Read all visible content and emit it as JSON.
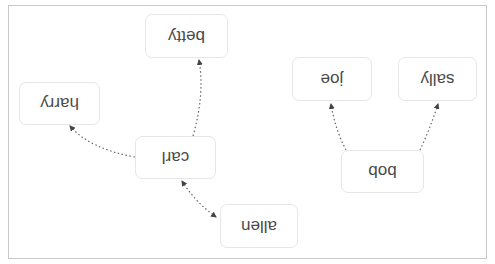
{
  "diagram": {
    "type": "tree-graph",
    "orientation": "rotated-180",
    "nodes": [
      {
        "id": "allen",
        "label": "allen"
      },
      {
        "id": "carl",
        "label": "carl"
      },
      {
        "id": "harry",
        "label": "harry"
      },
      {
        "id": "betty",
        "label": "betty"
      },
      {
        "id": "bob",
        "label": "bob"
      },
      {
        "id": "joe",
        "label": "joe"
      },
      {
        "id": "sally",
        "label": "sally"
      }
    ],
    "edges": [
      {
        "from": "allen",
        "to": "carl",
        "style": "dotted",
        "arrows": "both"
      },
      {
        "from": "carl",
        "to": "harry",
        "style": "dotted",
        "arrows": "to"
      },
      {
        "from": "carl",
        "to": "betty",
        "style": "dotted",
        "arrows": "to"
      },
      {
        "from": "bob",
        "to": "joe",
        "style": "dotted",
        "arrows": "to"
      },
      {
        "from": "bob",
        "to": "sally",
        "style": "dotted",
        "arrows": "to"
      }
    ],
    "colors": {
      "node_border": "#e6e6e6",
      "node_text": "#4a4a4a",
      "edge": "#555555",
      "frame": "#c8c8c8"
    }
  }
}
